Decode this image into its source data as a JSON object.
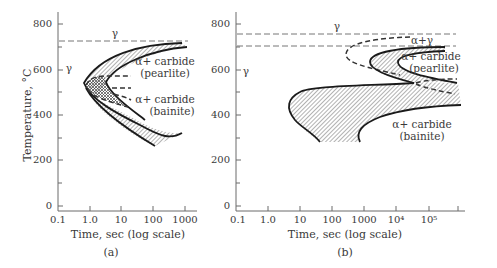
{
  "figure": {
    "panels": [
      {
        "id": "a",
        "caption": "(a)",
        "y_axis_label": "Temperature, °C",
        "x_axis_label": "Time, sec (log scale)",
        "y_ticks": [
          "800",
          "600",
          "400",
          "200",
          "0"
        ],
        "x_ticks": [
          "0.1",
          "1.0",
          "10",
          "100",
          "1000"
        ],
        "labels": {
          "gamma_top": "γ",
          "gamma_left": "γ",
          "pearlite_1": "α+ carbide",
          "pearlite_2": "(pearlite)",
          "bainite_1": "α+ carbide",
          "bainite_2": "(bainite)"
        }
      },
      {
        "id": "b",
        "caption": "(b)",
        "x_axis_label": "Time, sec (log scale)",
        "y_ticks": [
          "800",
          "600",
          "400",
          "200",
          "0"
        ],
        "x_ticks": [
          "0.1",
          "1.0",
          "10",
          "100",
          "1000",
          "10⁴",
          "10⁵"
        ],
        "labels": {
          "gamma_top": "γ",
          "gamma_left": "γ",
          "alpha_gamma": "α+γ",
          "pearlite_1": "α+ carbide",
          "pearlite_2": "(pearlite)",
          "bainite_1": "α+ carbide",
          "bainite_2": "(bainite)"
        }
      }
    ]
  }
}
